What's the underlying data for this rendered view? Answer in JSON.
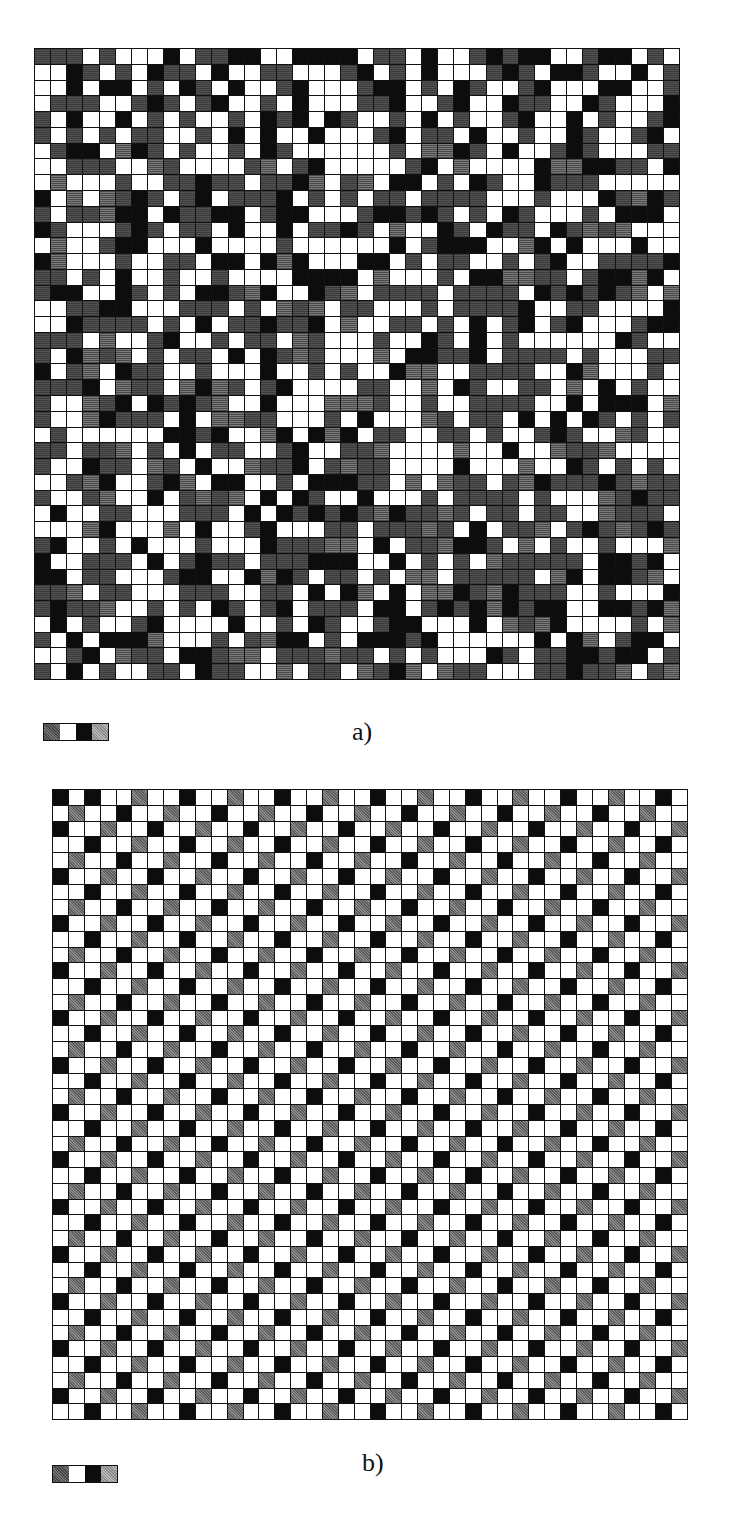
{
  "figure": {
    "panels": [
      {
        "id": "a",
        "label": "a)",
        "rows": 40,
        "cols": 40,
        "pattern": "disordered",
        "first_rows": [
          "GGGWGWWWBWGGBBWWBBBBWGGWBWWGBGBBWWGBBWGW",
          "WWBGWGWBGGWBWWGGWWWGBWGWBWWWGBGWBBGWWBWG",
          "WWBWBBWGWBGWBWWGBWWWGBBWGWBGWWGBWWWBBWWG",
          "WGGGWWGBGWGBWWGWBWWWGGBWWGBWWBGGWWBGWWWB",
          "GWBWWBWGWGWWGWBGBWBGWWGWBWGWWGBWWBWGWWGB",
          "GWGWGWGGWWGWBWBWWBWWWGBWGGWBWWGWWBGWWGBW"
        ],
        "legend": [
          "dark-gray",
          "white",
          "black",
          "light-gray"
        ]
      },
      {
        "id": "b",
        "label": "b)",
        "rows": 40,
        "cols": 40,
        "pattern": "ordered-diagonal",
        "rule": "nonwhite if (row+col) mod 3 == 2; black if col even else gray",
        "legend": [
          "dark-gray",
          "white",
          "black",
          "light-gray"
        ]
      }
    ],
    "colors": {
      "black": "#0d0d0d",
      "white": "#ffffff",
      "dark-gray": "#5e5e5e",
      "light-gray": "#a8a8a8",
      "grid-line": "#111111"
    }
  }
}
